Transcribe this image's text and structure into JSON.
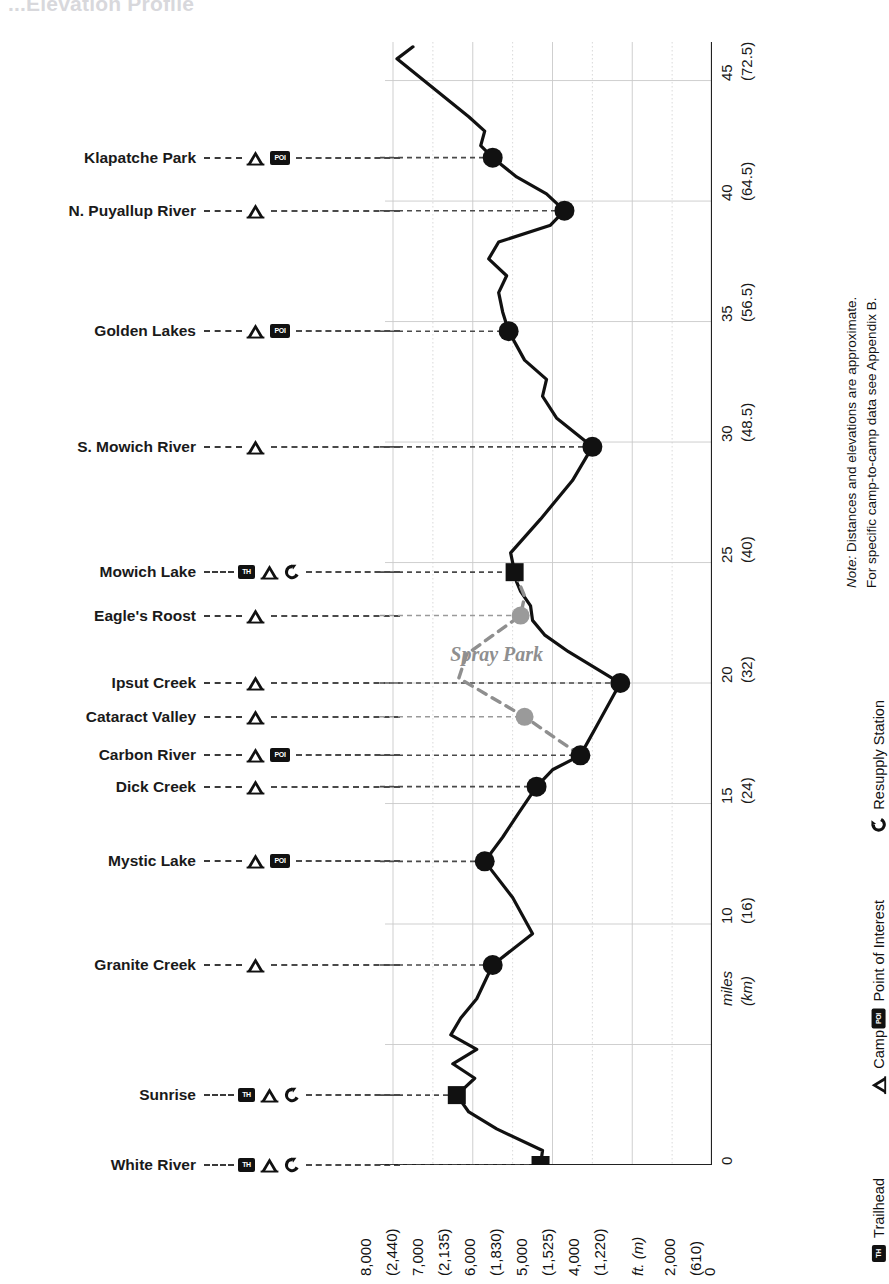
{
  "title": "...Elevation Profile",
  "note": {
    "line1_em": "Note:",
    "line1": " Distances and elevations are approximate.",
    "line2": "For specific camp-to-camp data see Appendix B."
  },
  "legend": [
    {
      "icon": "trailhead-icon",
      "glyph": "TH",
      "label": "Trailhead"
    },
    {
      "icon": "camp-icon",
      "glyph": "",
      "label": "Camp"
    },
    {
      "icon": "poi-icon",
      "glyph": "POI",
      "label": "Point of Interest"
    },
    {
      "icon": "resupply-icon",
      "glyph": "",
      "label": "Resupply Station"
    }
  ],
  "axes": {
    "distance_axis_label": {
      "unit": "miles",
      "unit_alt": "(km)"
    },
    "elevation_axis_label": {
      "unit": "ft. (m)"
    },
    "distance_ticks": [
      {
        "mi": "0",
        "km": ""
      },
      {
        "mi": "10",
        "km": "(16)"
      },
      {
        "mi": "15",
        "km": "(24)"
      },
      {
        "mi": "20",
        "km": "(32)"
      },
      {
        "mi": "25",
        "km": "(40)"
      },
      {
        "mi": "30",
        "km": "(48.5)"
      },
      {
        "mi": "35",
        "km": "(56.5)"
      },
      {
        "mi": "40",
        "km": "(64.5)"
      },
      {
        "mi": "45",
        "km": "(72.5)"
      }
    ],
    "elevation_ticks": [
      "8,000",
      "(2,440)",
      "7,000",
      "(2,135)",
      "6,000",
      "(1,830)",
      "5,000",
      "(1,525)",
      "4,000",
      "(1,220)",
      "ft. (m)",
      "2,000",
      "(610)",
      "0"
    ]
  },
  "stations": [
    {
      "name": "Klapatche Park",
      "icons": [
        "camp",
        "poi"
      ],
      "mile": 41.8,
      "elev": 5500
    },
    {
      "name": "N. Puyallup River",
      "icons": [
        "camp"
      ],
      "mile": 39.6,
      "elev": 3700
    },
    {
      "name": "Golden Lakes",
      "icons": [
        "camp",
        "poi"
      ],
      "mile": 34.6,
      "elev": 5100
    },
    {
      "name": "S. Mowich River",
      "icons": [
        "camp"
      ],
      "mile": 29.8,
      "elev": 3000
    },
    {
      "name": "Mowich Lake",
      "icons": [
        "trailhead",
        "camp",
        "resupply"
      ],
      "mile": 24.6,
      "elev": 4950
    },
    {
      "name": "Eagle's Roost",
      "icons": [
        "camp"
      ],
      "mile": 22.8,
      "elev": 4800
    },
    {
      "name": "Ipsut Creek",
      "icons": [
        "camp"
      ],
      "mile": 20.0,
      "elev": 2300
    },
    {
      "name": "Cataract Valley",
      "icons": [
        "camp"
      ],
      "mile": 18.6,
      "elev": 4700
    },
    {
      "name": "Carbon River",
      "icons": [
        "camp",
        "poi"
      ],
      "mile": 17.0,
      "elev": 3300
    },
    {
      "name": "Dick Creek",
      "icons": [
        "camp"
      ],
      "mile": 15.7,
      "elev": 4400
    },
    {
      "name": "Mystic Lake",
      "icons": [
        "camp",
        "poi"
      ],
      "mile": 12.6,
      "elev": 5700
    },
    {
      "name": "Granite Creek",
      "icons": [
        "camp"
      ],
      "mile": 8.3,
      "elev": 5500
    },
    {
      "name": "Sunrise",
      "icons": [
        "trailhead",
        "camp",
        "resupply"
      ],
      "mile": 2.9,
      "elev": 6400
    },
    {
      "name": "White River",
      "icons": [
        "trailhead",
        "camp",
        "resupply"
      ],
      "mile": 0.0,
      "elev": 4300
    }
  ],
  "alternate_route": {
    "name": "Spray Park",
    "color": "#8f8f8f"
  },
  "chart_data": {
    "type": "line",
    "title": "Elevation Profile",
    "orientation": "rotated-90",
    "xlabel": "ft. (m)",
    "ylabel": "miles (km)",
    "xlim": [
      0,
      8800
    ],
    "ylim": [
      0,
      46
    ],
    "grid": true,
    "series": [
      {
        "name": "Wonderland Trail (main)",
        "color": "#111111",
        "points": [
          [
            0.0,
            4300
          ],
          [
            0.6,
            4250
          ],
          [
            1.5,
            5400
          ],
          [
            2.2,
            6100
          ],
          [
            2.9,
            6400
          ],
          [
            3.6,
            5950
          ],
          [
            4.2,
            6500
          ],
          [
            4.8,
            5900
          ],
          [
            5.4,
            6550
          ],
          [
            6.1,
            6300
          ],
          [
            6.9,
            5900
          ],
          [
            8.3,
            5500
          ],
          [
            9.6,
            4500
          ],
          [
            11.1,
            5000
          ],
          [
            12.6,
            5700
          ],
          [
            13.6,
            5250
          ],
          [
            14.6,
            4850
          ],
          [
            15.7,
            4400
          ],
          [
            16.4,
            4000
          ],
          [
            17.0,
            3300
          ],
          [
            17.6,
            3100
          ],
          [
            18.2,
            2900
          ],
          [
            20.0,
            2300
          ],
          [
            21.3,
            3600
          ],
          [
            22.0,
            4200
          ],
          [
            22.6,
            4500
          ],
          [
            23.2,
            4550
          ],
          [
            23.8,
            4800
          ],
          [
            24.2,
            4900
          ],
          [
            24.6,
            4950
          ],
          [
            25.4,
            5050
          ],
          [
            26.8,
            4300
          ],
          [
            28.4,
            3500
          ],
          [
            29.8,
            3000
          ],
          [
            31.0,
            3900
          ],
          [
            31.9,
            4250
          ],
          [
            32.6,
            4150
          ],
          [
            33.4,
            4700
          ],
          [
            34.0,
            4900
          ],
          [
            34.6,
            5100
          ],
          [
            35.4,
            5250
          ],
          [
            36.2,
            5350
          ],
          [
            36.9,
            5150
          ],
          [
            37.6,
            5600
          ],
          [
            38.3,
            5350
          ],
          [
            39.0,
            4050
          ],
          [
            39.6,
            3700
          ],
          [
            40.3,
            4150
          ],
          [
            41.0,
            4900
          ],
          [
            41.8,
            5500
          ],
          [
            42.3,
            5800
          ],
          [
            42.9,
            5700
          ],
          [
            43.5,
            6100
          ],
          [
            45.9,
            7900
          ],
          [
            46.4,
            7500
          ]
        ]
      },
      {
        "name": "Spray Park (alternate)",
        "color": "#8f8f8f",
        "style": "dashed",
        "points": [
          [
            24.6,
            4950
          ],
          [
            23.6,
            4700
          ],
          [
            22.8,
            4800
          ],
          [
            21.2,
            6150
          ],
          [
            20.2,
            6350
          ],
          [
            18.6,
            4700
          ],
          [
            17.0,
            3300
          ]
        ]
      }
    ],
    "markers": [
      {
        "label": "White River",
        "mile": 0.0,
        "elev": 4300,
        "shape": "square"
      },
      {
        "label": "Sunrise",
        "mile": 2.9,
        "elev": 6400,
        "shape": "square"
      },
      {
        "label": "Granite Creek",
        "mile": 8.3,
        "elev": 5500,
        "shape": "circle"
      },
      {
        "label": "Mystic Lake",
        "mile": 12.6,
        "elev": 5700,
        "shape": "circle"
      },
      {
        "label": "Dick Creek",
        "mile": 15.7,
        "elev": 4400,
        "shape": "circle"
      },
      {
        "label": "Carbon River",
        "mile": 17.0,
        "elev": 3300,
        "shape": "circle"
      },
      {
        "label": "Ipsut Creek",
        "mile": 20.0,
        "elev": 2300,
        "shape": "circle"
      },
      {
        "label": "Mowich Lake",
        "mile": 24.6,
        "elev": 4950,
        "shape": "square"
      },
      {
        "label": "S. Mowich River",
        "mile": 29.8,
        "elev": 3000,
        "shape": "circle"
      },
      {
        "label": "Golden Lakes",
        "mile": 34.6,
        "elev": 5100,
        "shape": "circle"
      },
      {
        "label": "N. Puyallup River",
        "mile": 39.6,
        "elev": 3700,
        "shape": "circle"
      },
      {
        "label": "Klapatche Park",
        "mile": 41.8,
        "elev": 5500,
        "shape": "circle"
      },
      {
        "label": "Cataract Valley",
        "mile": 18.6,
        "elev": 4700,
        "shape": "circle-gray"
      },
      {
        "label": "Eagle's Roost",
        "mile": 22.8,
        "elev": 4800,
        "shape": "circle-gray"
      }
    ]
  }
}
